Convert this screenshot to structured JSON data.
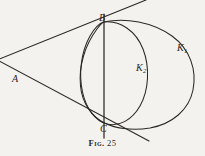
{
  "figure": {
    "caption_prefix": "Fig.",
    "caption_number": "25",
    "caption_full": "Fig. 25"
  },
  "labels": {
    "point_a": "A",
    "point_b": "B",
    "point_c": "C",
    "curve_k1_base": "K",
    "curve_k1_sub": "1",
    "curve_k2_base": "K",
    "curve_k2_sub": "2"
  },
  "colors": {
    "ink": "#2a2724",
    "paper": "#f4f2ee"
  },
  "geometry": {
    "type": "plane-geometry-diagram",
    "description": "Two conics K1 and K2 through common points B and C, with the chord BC and two tangent lines meeting at external point A",
    "points": {
      "A": [
        16,
        72
      ],
      "B": [
        103.5,
        22
      ],
      "C": [
        104.5,
        123
      ]
    },
    "chord_BC": {
      "x1": 104,
      "y1": 14,
      "x2": 104,
      "y2": 138
    },
    "tangent_upper": {
      "x1": 0,
      "y1": 60,
      "x2": 146,
      "y2": 0
    },
    "tangent_lower": {
      "x1": 0,
      "y1": 62,
      "x2": 149,
      "y2": 141
    },
    "curve_K1": {
      "kind": "circle",
      "center": [
        141,
        73
      ],
      "radius": 55,
      "note": "large outer circle passing through B and C"
    },
    "curve_K2": {
      "kind": "ellipse",
      "center": [
        108,
        72
      ],
      "rx": 45,
      "ry": 51,
      "rotation_deg": -6,
      "note": "inner oval passing through B and C"
    }
  }
}
